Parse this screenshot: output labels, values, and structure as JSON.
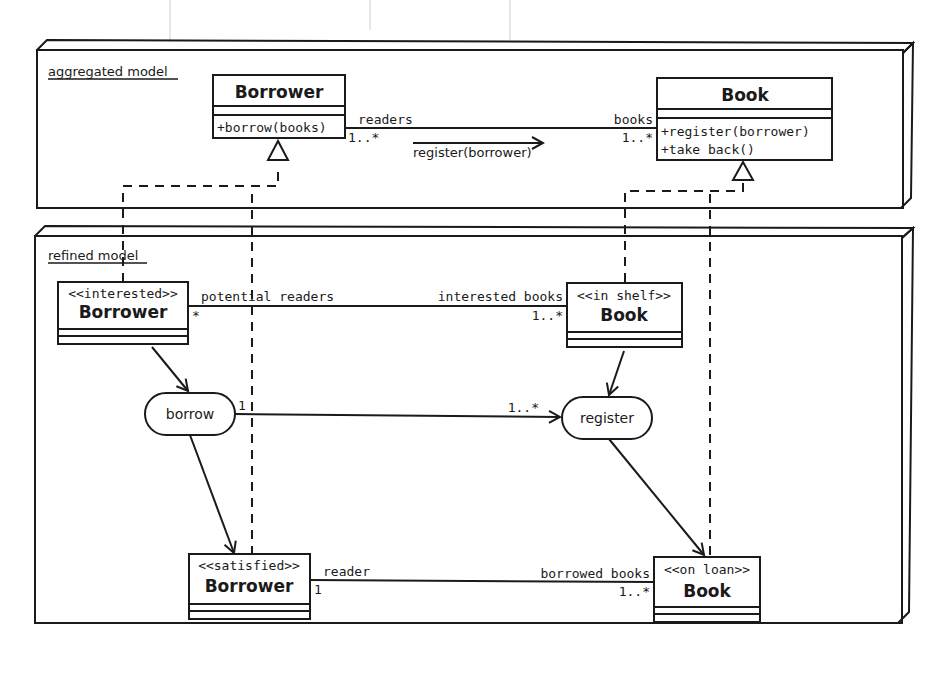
{
  "packages": {
    "aggregated": {
      "label": "aggregated model"
    },
    "refined": {
      "label": "refined model"
    }
  },
  "aggregated_model": {
    "borrower": {
      "name": "Borrower",
      "operations": [
        "+borrow(books)"
      ]
    },
    "book": {
      "name": "Book",
      "operations": [
        "+register(borrower)",
        "+take back()"
      ]
    },
    "association": {
      "left_role": "readers",
      "left_multiplicity": "1..*",
      "right_role": "books",
      "right_multiplicity": "1..*",
      "message": "register(borrower)"
    }
  },
  "refined_model": {
    "interested_borrower": {
      "stereotype": "<<interested>>",
      "name": "Borrower"
    },
    "in_shelf_book": {
      "stereotype": "<<in shelf>>",
      "name": "Book"
    },
    "satisfied_borrower": {
      "stereotype": "<<satisfied>>",
      "name": "Borrower"
    },
    "on_loan_book": {
      "stereotype": "<<on loan>>",
      "name": "Book"
    },
    "actions": {
      "borrow": "borrow",
      "register": "register"
    },
    "associations": {
      "top": {
        "left_role": "potential readers",
        "left_multiplicity": "*",
        "right_role": "interested books",
        "right_multiplicity": "1..*"
      },
      "middle": {
        "left_multiplicity": "1",
        "right_multiplicity": "1..*"
      },
      "bottom": {
        "left_role": "reader",
        "left_multiplicity": "1",
        "right_role": "borrowed books",
        "right_multiplicity": "1..*"
      }
    }
  },
  "colors": {
    "line": "#1a1a1a",
    "background": "#ffffff"
  }
}
